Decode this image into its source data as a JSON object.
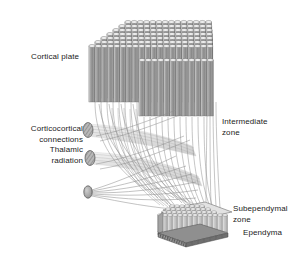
{
  "figure": {
    "background_color": "#ffffff",
    "width": 305,
    "height": 258
  },
  "labels": {
    "cortical_plate": "Cortical plate",
    "corticocortical_line1": "Corticocortical",
    "corticocortical_line2": "connections",
    "thalamic_line1": "Thalamic",
    "thalamic_line2": "radiation",
    "intermediate_line1": "Intermediate",
    "intermediate_line2": "zone",
    "subependymal_line1": "Subependymal",
    "subependymal_line2": "zone",
    "ependyma": "Ependyma"
  },
  "structures": {
    "cortical_plate": {
      "name": "cortical-plate-block",
      "description": "Isometric block of densely packed vertical cylindrical cortical columns with elliptical tops",
      "columns_per_row": 22,
      "rows": 7,
      "fill_color": "#8e8e8e",
      "top_color": "#e6e6e6",
      "outline_color": "#5b5b5b"
    },
    "subependymal_zone": {
      "name": "subependymal-zone-block",
      "description": "Small flat isometric block of short cylinders above a dark striped ependymal band",
      "columns_per_row": 14,
      "rows": 5,
      "fill_color": "#bdbdbd",
      "top_color": "#ededed",
      "outline_color": "#6a6a6a"
    },
    "ependyma": {
      "name": "ependyma-band",
      "description": "Dark striped basal lamina band beneath the subependymal zone",
      "fill_color": "#7a7a7a"
    },
    "corticocortical_bundle": {
      "name": "corticocortical-fiber-bundle",
      "description": "Cut end ellipse with hatched fascicles extending as a tube toward the right",
      "end_fill": "#b4b4b4",
      "tube_fill": "#d8d8d8"
    },
    "thalamic_bundle": {
      "name": "thalamic-radiation-bundle",
      "description": "Cut end ellipse with hatched fascicles extending as a tube toward the right",
      "end_fill": "#9a9a9a",
      "tube_fill": "#d8d8d8"
    },
    "radiating_origin": {
      "name": "radiating-fiber-origin",
      "description": "Small dark ellipse from which thin fibers fan out to the cortical plate",
      "fill_color": "#808080"
    },
    "fibers": {
      "name": "axon-fibers",
      "description": "Thin curved gray fibers sweeping from the cortical plate base through the intermediate zone",
      "stroke_color": "#8a8a8a",
      "count": 60
    }
  }
}
